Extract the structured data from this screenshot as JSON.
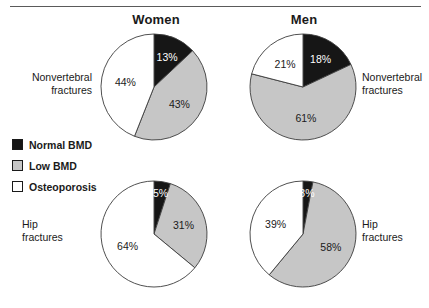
{
  "figure": {
    "column_titles": [
      "Women",
      "Men"
    ],
    "row_labels": [
      "Nonvertebral fractures",
      "Hip fractures"
    ],
    "row_label_lines": {
      "nonvertebral": [
        "Nonvertebral",
        "fractures"
      ],
      "hip": [
        "Hip",
        "fractures"
      ]
    }
  },
  "legend": {
    "items": [
      {
        "label": "Normal BMD",
        "color": "#161616",
        "swatch": "legend-swatch-normal-bmd"
      },
      {
        "label": "Low BMD",
        "color": "#c6c6c6",
        "swatch": "legend-swatch-low-bmd"
      },
      {
        "label": "Osteoporosis",
        "color": "#ffffff",
        "swatch": "legend-swatch-osteoporosis"
      }
    ]
  },
  "colors": {
    "normal_bmd": "#161616",
    "low_bmd": "#c6c6c6",
    "osteoporosis": "#ffffff",
    "outline": "#3c3c3c",
    "rule": "#5a5a5a",
    "text": "#1a1a1a"
  },
  "chart_data": {
    "type": "pie",
    "categories": [
      "Normal BMD",
      "Low BMD",
      "Osteoporosis"
    ],
    "legend_position": "left",
    "units": "percent",
    "start_angle_deg": 0,
    "direction": "clockwise",
    "charts": [
      {
        "id": "women-nonvertebral",
        "sex": "Women",
        "fracture_site": "Nonvertebral fractures",
        "values": [
          13,
          43,
          44
        ],
        "labels": [
          "13%",
          "43%",
          "44%"
        ]
      },
      {
        "id": "men-nonvertebral",
        "sex": "Men",
        "fracture_site": "Nonvertebral fractures",
        "values": [
          18,
          61,
          21
        ],
        "labels": [
          "18%",
          "61%",
          "21%"
        ]
      },
      {
        "id": "women-hip",
        "sex": "Women",
        "fracture_site": "Hip fractures",
        "values": [
          5,
          31,
          64
        ],
        "labels": [
          "5%",
          "31%",
          "64%"
        ]
      },
      {
        "id": "men-hip",
        "sex": "Men",
        "fracture_site": "Hip fractures",
        "values": [
          3,
          58,
          39
        ],
        "labels": [
          "3%",
          "58%",
          "39%"
        ]
      }
    ]
  }
}
